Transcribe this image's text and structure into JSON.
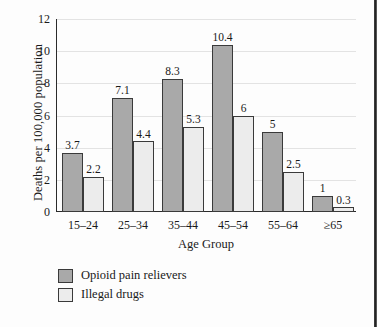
{
  "chart_data": {
    "type": "bar",
    "title": "",
    "xlabel": "Age Group",
    "ylabel": "Deaths per 100,000 population",
    "categories": [
      "15–24",
      "25–34",
      "35–44",
      "45–54",
      "55–64",
      "≥65"
    ],
    "series": [
      {
        "name": "Opioid pain relievers",
        "color": "#a9a9a9",
        "values": [
          3.7,
          7.1,
          8.3,
          10.4,
          5,
          1
        ],
        "labels": [
          "3.7",
          "7.1",
          "8.3",
          "10.4",
          "5",
          "1"
        ]
      },
      {
        "name": "Illegal drugs",
        "color": "#ececec",
        "values": [
          2.2,
          4.4,
          5.3,
          6,
          2.5,
          0.3
        ],
        "labels": [
          "2.2",
          "4.4",
          "5.3",
          "6",
          "2.5",
          "0.3"
        ]
      }
    ],
    "ylim": [
      0,
      12
    ],
    "yticks": [
      "0",
      "2",
      "4",
      "6",
      "8",
      "10",
      "12"
    ],
    "grid": "horizontal",
    "legend_position": "below-left"
  }
}
